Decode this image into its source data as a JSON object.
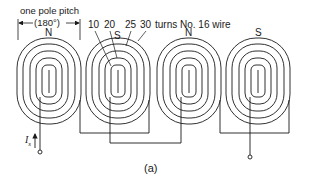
{
  "diagram": {
    "pole_pitch_label": "one pole pitch",
    "pole_pitch_angle": "(180°)",
    "turns_labels": [
      "10",
      "20",
      "25",
      "30"
    ],
    "turns_suffix": "turns No. 16 wire",
    "poles": [
      "N",
      "S",
      "N",
      "S"
    ],
    "current_label": "I",
    "current_subscript": "s",
    "caption": "(a)",
    "colors": {
      "line": "#1a1a1a",
      "background": "#ffffff"
    }
  }
}
